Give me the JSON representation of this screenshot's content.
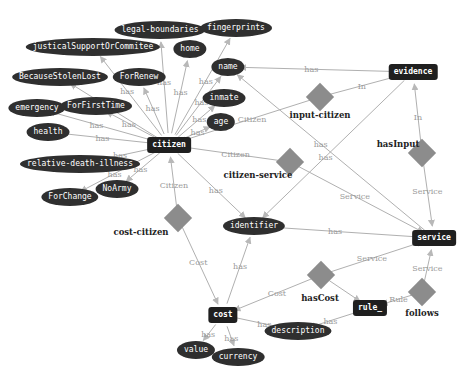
{
  "diagram": {
    "type": "ontology-graph",
    "colors": {
      "node_fill": "#2f2f2f",
      "class_fill": "#1f1f1f",
      "relation_fill": "#8c8c8c",
      "edge": "#b0b0b0",
      "edge_label": "#9a9a9a"
    },
    "classes": [
      {
        "id": "citizen",
        "label": "citizen",
        "x": 169,
        "y": 145
      },
      {
        "id": "evidence",
        "label": "evidence",
        "x": 413,
        "y": 72
      },
      {
        "id": "service",
        "label": "service",
        "x": 434,
        "y": 238
      },
      {
        "id": "cost",
        "label": "cost",
        "x": 223,
        "y": 315
      },
      {
        "id": "rule",
        "label": "rule_",
        "x": 370,
        "y": 308
      }
    ],
    "attributes": [
      {
        "id": "legal-boundaries",
        "label": "legal-boundaries",
        "x": 160,
        "y": 30
      },
      {
        "id": "fingerprints",
        "label": "fingerprints",
        "x": 236,
        "y": 28
      },
      {
        "id": "justical",
        "label": "justicalSupportOrCommitee",
        "x": 93,
        "y": 47
      },
      {
        "id": "home",
        "label": "home",
        "x": 190,
        "y": 49
      },
      {
        "id": "name",
        "label": "name",
        "x": 228,
        "y": 67
      },
      {
        "id": "BecauseStolenLost",
        "label": "BecauseStolenLost",
        "x": 60,
        "y": 77
      },
      {
        "id": "ForRenew",
        "label": "ForRenew",
        "x": 139,
        "y": 77
      },
      {
        "id": "inmate",
        "label": "inmate",
        "x": 224,
        "y": 98
      },
      {
        "id": "ForFirstTime",
        "label": "ForFirstTime",
        "x": 96,
        "y": 106
      },
      {
        "id": "emergency",
        "label": "emergency",
        "x": 37,
        "y": 108
      },
      {
        "id": "age",
        "label": "age",
        "x": 221,
        "y": 122
      },
      {
        "id": "health",
        "label": "health",
        "x": 48,
        "y": 132
      },
      {
        "id": "relative-death-illness",
        "label": "relative-death-illness",
        "x": 80,
        "y": 164
      },
      {
        "id": "NoArmy",
        "label": "NoArmy",
        "x": 117,
        "y": 189
      },
      {
        "id": "ForChange",
        "label": "ForChange",
        "x": 70,
        "y": 197
      },
      {
        "id": "identifier",
        "label": "identifier",
        "x": 254,
        "y": 226
      },
      {
        "id": "description",
        "label": "description",
        "x": 298,
        "y": 331
      },
      {
        "id": "value",
        "label": "value",
        "x": 196,
        "y": 350
      },
      {
        "id": "currency",
        "label": "currency",
        "x": 238,
        "y": 357
      }
    ],
    "relations": [
      {
        "id": "input-citizen",
        "label": "input-citizen",
        "x": 320,
        "y": 97,
        "lx": 320,
        "ly": 115
      },
      {
        "id": "hasInput",
        "label": "hasInput",
        "x": 422,
        "y": 153,
        "lx": 398,
        "ly": 144
      },
      {
        "id": "citizen-service",
        "label": "citizen-service",
        "x": 290,
        "y": 162,
        "lx": 258,
        "ly": 175
      },
      {
        "id": "cost-citizen",
        "label": "cost-citizen",
        "x": 178,
        "y": 218,
        "lx": 141,
        "ly": 232
      },
      {
        "id": "hasCost",
        "label": "hasCost",
        "x": 321,
        "y": 275,
        "lx": 320,
        "ly": 298
      },
      {
        "id": "follows",
        "label": "follows",
        "x": 422,
        "y": 292,
        "lx": 422,
        "ly": 313
      }
    ],
    "edges": [
      {
        "from": "citizen",
        "to": "legal-boundaries",
        "label": "has"
      },
      {
        "from": "citizen",
        "to": "fingerprints",
        "label": "has"
      },
      {
        "from": "citizen",
        "to": "justical",
        "label": "has"
      },
      {
        "from": "citizen",
        "to": "home",
        "label": "has"
      },
      {
        "from": "citizen",
        "to": "name",
        "label": "has"
      },
      {
        "from": "citizen",
        "to": "BecauseStolenLost",
        "label": "has"
      },
      {
        "from": "citizen",
        "to": "ForRenew",
        "label": "has"
      },
      {
        "from": "citizen",
        "to": "inmate",
        "label": "has"
      },
      {
        "from": "citizen",
        "to": "ForFirstTime",
        "label": "has"
      },
      {
        "from": "citizen",
        "to": "emergency",
        "label": "has"
      },
      {
        "from": "citizen",
        "to": "age",
        "label": "has"
      },
      {
        "from": "citizen",
        "to": "health",
        "label": "has"
      },
      {
        "from": "citizen",
        "to": "relative-death-illness",
        "label": "has"
      },
      {
        "from": "citizen",
        "to": "NoArmy",
        "label": "has"
      },
      {
        "from": "citizen",
        "to": "ForChange",
        "label": "has"
      },
      {
        "from": "citizen",
        "to": "identifier",
        "label": "has"
      },
      {
        "from": "evidence",
        "to": "name",
        "label": "has"
      },
      {
        "from": "evidence",
        "to": "identifier",
        "label": "has"
      },
      {
        "from": "service",
        "to": "name",
        "label": "has"
      },
      {
        "from": "service",
        "to": "identifier",
        "label": "has"
      },
      {
        "from": "cost",
        "to": "identifier",
        "label": "has"
      },
      {
        "from": "cost",
        "to": "description",
        "label": "has"
      },
      {
        "from": "cost",
        "to": "value",
        "label": "has"
      },
      {
        "from": "cost",
        "to": "currency",
        "label": "has"
      },
      {
        "from": "rule",
        "to": "description",
        "label": "has"
      },
      {
        "from": "input-citizen",
        "to": "citizen",
        "label": "Citizen"
      },
      {
        "from": "input-citizen",
        "to": "evidence",
        "label": "In"
      },
      {
        "from": "hasInput",
        "to": "evidence",
        "label": "In"
      },
      {
        "from": "hasInput",
        "to": "service",
        "label": "Service"
      },
      {
        "from": "citizen-service",
        "to": "citizen",
        "label": "Citizen"
      },
      {
        "from": "citizen-service",
        "to": "service",
        "label": "Service"
      },
      {
        "from": "cost-citizen",
        "to": "citizen",
        "label": "Citizen"
      },
      {
        "from": "cost-citizen",
        "to": "cost",
        "label": "Cost"
      },
      {
        "from": "hasCost",
        "to": "cost",
        "label": "Cost"
      },
      {
        "from": "hasCost",
        "to": "service",
        "label": "Service"
      },
      {
        "from": "hasCost",
        "to": "rule",
        "label": ""
      },
      {
        "from": "follows",
        "to": "service",
        "label": "Service"
      },
      {
        "from": "follows",
        "to": "rule",
        "label": "Rule"
      }
    ]
  }
}
